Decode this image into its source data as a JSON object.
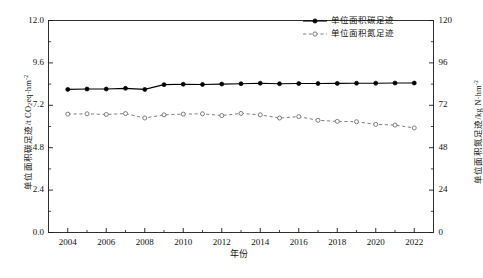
{
  "chart_data": {
    "type": "line",
    "title": "",
    "xlabel": "年份",
    "ylabel": "单位面积碳足迹/t CO2eq·hm-2",
    "ylabel_right": "单位面积氮足迹/kg N·hm-2",
    "xlim": [
      2003,
      2023
    ],
    "ylim": [
      0.0,
      12.0
    ],
    "ylim_right": [
      0,
      120
    ],
    "grid": false,
    "legend_position": "top-right",
    "x": [
      2004,
      2005,
      2006,
      2007,
      2008,
      2009,
      2010,
      2011,
      2012,
      2013,
      2014,
      2015,
      2016,
      2017,
      2018,
      2019,
      2020,
      2021,
      2022
    ],
    "xticks": [
      "2004",
      "2006",
      "2008",
      "2010",
      "2012",
      "2014",
      "2016",
      "2018",
      "2020",
      "2022"
    ],
    "yticks_left": [
      "0.0",
      "2.4",
      "4.8",
      "7.2",
      "9.6",
      "12.0"
    ],
    "yticks_right": [
      "0",
      "24",
      "48",
      "72",
      "96",
      "120"
    ],
    "series": [
      {
        "name": "单位面积碳足迹",
        "axis": "left",
        "unit": "t CO2eq·hm-2",
        "marker": "filled-circle",
        "linestyle": "solid",
        "color": "#000000",
        "values": [
          8.1,
          8.12,
          8.12,
          8.16,
          8.1,
          8.37,
          8.39,
          8.38,
          8.4,
          8.42,
          8.45,
          8.42,
          8.43,
          8.43,
          8.44,
          8.45,
          8.45,
          8.46,
          8.46
        ]
      },
      {
        "name": "单位面积氮足迹",
        "axis": "right",
        "unit": "kg N·hm-2",
        "marker": "open-circle",
        "linestyle": "dashed",
        "color": "#6f6f6f",
        "values": [
          67.0,
          67.2,
          66.8,
          67.3,
          64.8,
          66.6,
          67.0,
          67.2,
          66.2,
          67.4,
          66.6,
          64.8,
          65.6,
          63.5,
          62.9,
          62.7,
          61.2,
          60.8,
          59.2
        ]
      }
    ]
  },
  "legend": {
    "items": [
      {
        "label": "单位面积碳足迹",
        "style": "solid-filled-marker"
      },
      {
        "label": "单位面积氮足迹",
        "style": "dashed-open-marker"
      }
    ]
  },
  "axis_titles": {
    "left_prefix": "单位面积碳足迹/t CO",
    "left_sub": "2",
    "left_mid": "eq·hm",
    "left_sup": "-2",
    "right_prefix": "单位面积氮足迹/kg N·hm",
    "right_sup": "-2",
    "x": "年份"
  },
  "caption": {
    "text": ""
  }
}
